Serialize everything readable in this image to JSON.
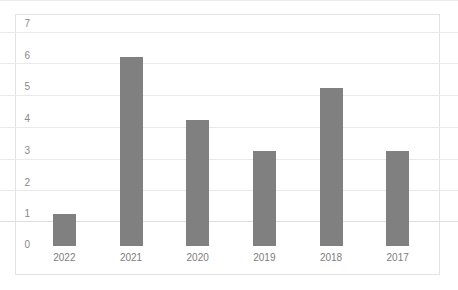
{
  "chart_data": {
    "type": "bar",
    "title": "",
    "subtitle": "",
    "xlabel": "",
    "ylabel": "",
    "categories": [
      "2022",
      "2021",
      "2020",
      "2019",
      "2018",
      "2017"
    ],
    "values": [
      1,
      6,
      4,
      3,
      5,
      3
    ],
    "series": [
      {
        "name": "",
        "values": [
          1,
          6,
          4,
          3,
          5,
          3
        ]
      }
    ],
    "ylim": [
      0,
      7
    ],
    "ytick_step": 1,
    "yticks": [
      "7",
      "6",
      "5",
      "4",
      "3",
      "2",
      "1",
      "0"
    ],
    "ytick_values": [
      7,
      6,
      5,
      4,
      3,
      2,
      1,
      0
    ],
    "grid": true,
    "grid_axis": "y",
    "legend": false,
    "legend_position": "none",
    "annotations": [],
    "colors": {
      "bar": "#808080",
      "gridline": "#e9e9e9",
      "baseline": "#dedede",
      "frame": "#e3e3e3",
      "tick_label": "#888888",
      "category_label": "#7d7d7d",
      "background": "#ffffff"
    }
  }
}
